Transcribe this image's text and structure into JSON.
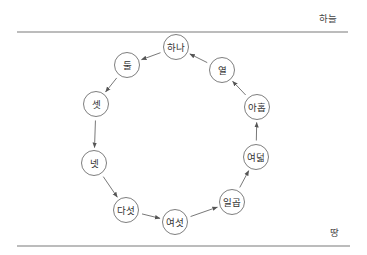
{
  "boundaries": {
    "top_label": "하늘",
    "bottom_label": "땅"
  },
  "nodes": [
    {
      "id": "n1",
      "label": "하나"
    },
    {
      "id": "n2",
      "label": "둘"
    },
    {
      "id": "n3",
      "label": "셋"
    },
    {
      "id": "n4",
      "label": "넷"
    },
    {
      "id": "n5",
      "label": "다섯"
    },
    {
      "id": "n6",
      "label": "여섯"
    },
    {
      "id": "n7",
      "label": "일곱"
    },
    {
      "id": "n8",
      "label": "여덟"
    },
    {
      "id": "n9",
      "label": "아홉"
    },
    {
      "id": "n10",
      "label": "열"
    }
  ],
  "edges": [
    {
      "from": "n1",
      "to": "n2"
    },
    {
      "from": "n2",
      "to": "n3"
    },
    {
      "from": "n3",
      "to": "n4"
    },
    {
      "from": "n4",
      "to": "n5"
    },
    {
      "from": "n5",
      "to": "n6"
    },
    {
      "from": "n6",
      "to": "n7"
    },
    {
      "from": "n7",
      "to": "n8"
    },
    {
      "from": "n8",
      "to": "n9"
    },
    {
      "from": "n9",
      "to": "n10"
    },
    {
      "from": "n10",
      "to": "n1"
    }
  ],
  "colors": {
    "line": "#7a7a7a",
    "node_stroke": "#6f6f6f",
    "arrow": "#555555",
    "text": "#333333"
  }
}
